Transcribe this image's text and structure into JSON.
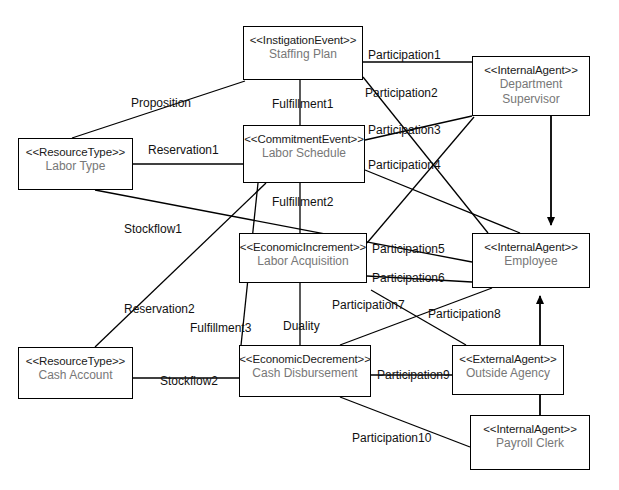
{
  "diagram": {
    "type": "uml-class-diagram",
    "width": 619,
    "height": 490,
    "stroke_color": "#000000",
    "fill_color": "#ffffff",
    "label_color": "#111111",
    "name_color": "#777777"
  },
  "nodes": [
    {
      "id": "staffing-plan",
      "stereotype": "<<InstigationEvent>>",
      "name": "Staffing Plan",
      "x": 243,
      "y": 26,
      "w": 120,
      "h": 54
    },
    {
      "id": "department-supervisor",
      "stereotype": "<<InternalAgent>>",
      "name": "Department Supervisor",
      "name_line1": "Department",
      "name_line2": "Supervisor",
      "x": 472,
      "y": 56,
      "w": 118,
      "h": 60
    },
    {
      "id": "labor-type",
      "stereotype": "<<ResourceType>>",
      "name": "Labor Type",
      "x": 18,
      "y": 138,
      "w": 115,
      "h": 52
    },
    {
      "id": "labor-schedule",
      "stereotype": "<<CommitmentEvent>>",
      "name": "Labor Schedule",
      "x": 243,
      "y": 125,
      "w": 122,
      "h": 58
    },
    {
      "id": "labor-acquisition",
      "stereotype": "<<EconomicIncrement>>",
      "name": "Labor Acquisition",
      "x": 239,
      "y": 233,
      "w": 128,
      "h": 50
    },
    {
      "id": "employee",
      "stereotype": "<<InternalAgent>>",
      "name": "Employee",
      "x": 472,
      "y": 233,
      "w": 118,
      "h": 55
    },
    {
      "id": "cash-account",
      "stereotype": "<<ResourceType>>",
      "name": "Cash Account",
      "x": 18,
      "y": 347,
      "w": 115,
      "h": 52
    },
    {
      "id": "cash-disbursement",
      "stereotype": "<<EconomicDecrement>>",
      "name": "Cash Disbursement",
      "x": 239,
      "y": 345,
      "w": 132,
      "h": 52
    },
    {
      "id": "outside-agency",
      "stereotype": "<<ExternalAgent>>",
      "name": "Outside Agency",
      "x": 452,
      "y": 345,
      "w": 112,
      "h": 50
    },
    {
      "id": "payroll-clerk",
      "stereotype": "<<InternalAgent>>",
      "name": "Payroll Clerk",
      "x": 470,
      "y": 415,
      "w": 120,
      "h": 55
    }
  ],
  "edges": [
    {
      "id": "proposition",
      "label": "Proposition",
      "from": "labor-type",
      "to": "staffing-plan",
      "lx": 131,
      "ly": 97
    },
    {
      "id": "reservation1",
      "label": "Reservation1",
      "from": "labor-type",
      "to": "labor-schedule",
      "lx": 148,
      "ly": 144
    },
    {
      "id": "fulfillment1",
      "label": "Fulfillment1",
      "from": "staffing-plan",
      "to": "labor-schedule",
      "lx": 272,
      "ly": 98
    },
    {
      "id": "fulfillment2",
      "label": "Fulfillment2",
      "from": "labor-schedule",
      "to": "labor-acquisition",
      "lx": 272,
      "ly": 196
    },
    {
      "id": "fulfillment3",
      "label": "Fulfillment3",
      "from": "labor-schedule",
      "to": "cash-disbursement",
      "lx": 190,
      "ly": 322
    },
    {
      "id": "stockflow1",
      "label": "Stockflow1",
      "from": "labor-type",
      "to": "employee",
      "lx": 124,
      "ly": 223
    },
    {
      "id": "reservation2",
      "label": "Reservation2",
      "from": "cash-account",
      "to": "labor-schedule",
      "lx": 124,
      "ly": 303
    },
    {
      "id": "stockflow2",
      "label": "Stockflow2",
      "from": "cash-account",
      "to": "cash-disbursement",
      "lx": 160,
      "ly": 375
    },
    {
      "id": "duality",
      "label": "Duality",
      "from": "labor-acquisition",
      "to": "cash-disbursement",
      "lx": 283,
      "ly": 320
    },
    {
      "id": "participation1",
      "label": "Participation1",
      "from": "staffing-plan",
      "to": "department-supervisor",
      "lx": 368,
      "ly": 49
    },
    {
      "id": "participation2",
      "label": "Participation2",
      "from": "staffing-plan",
      "to": "employee",
      "lx": 365,
      "ly": 87
    },
    {
      "id": "participation3",
      "label": "Participation3",
      "from": "labor-schedule",
      "to": "department-supervisor",
      "lx": 368,
      "ly": 124
    },
    {
      "id": "participation4",
      "label": "Participation4",
      "from": "labor-schedule",
      "to": "employee",
      "lx": 368,
      "ly": 159
    },
    {
      "id": "participation5",
      "label": "Participation5",
      "from": "labor-acquisition",
      "to": "department-supervisor",
      "lx": 372,
      "ly": 243
    },
    {
      "id": "participation6",
      "label": "Participation6",
      "from": "labor-acquisition",
      "to": "employee",
      "lx": 372,
      "ly": 272
    },
    {
      "id": "participation7",
      "label": "Participation7",
      "from": "cash-disbursement",
      "to": "employee",
      "lx": 332,
      "ly": 300
    },
    {
      "id": "participation8",
      "label": "Participation8",
      "from": "cash-disbursement",
      "to": "outside-agency",
      "lx": 428,
      "ly": 308
    },
    {
      "id": "participation9",
      "label": "Participation9",
      "from": "cash-disbursement",
      "to": "outside-agency",
      "lx": 377,
      "ly": 369
    },
    {
      "id": "participation10",
      "label": "Participation10",
      "from": "cash-disbursement",
      "to": "payroll-clerk",
      "lx": 352,
      "ly": 432
    }
  ],
  "generalizations": [
    {
      "id": "supervisor-is-employee",
      "from": "department-supervisor",
      "to": "employee",
      "arrow": "open-arrow"
    },
    {
      "id": "clerk-is-employee",
      "from": "payroll-clerk",
      "to": "employee",
      "arrow": "open-arrow"
    }
  ]
}
